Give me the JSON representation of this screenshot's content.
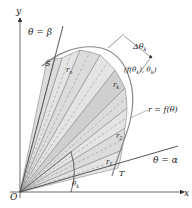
{
  "diagram": {
    "labels": {
      "y_axis": "y",
      "x_axis": "x",
      "origin": "O",
      "theta_beta": "θ = β",
      "theta_alpha": "θ = α",
      "point_S": "S",
      "point_T": "T",
      "r_n": "r",
      "r_n_sub": "n",
      "r_k": "r",
      "r_k_sub": "k",
      "r_2": "r",
      "r_2_sub": "2",
      "r_1": "r",
      "r_1_sub": "1",
      "delta_theta": "Δθ",
      "delta_theta_sub": "k",
      "point_label": "(f(θ",
      "point_label_sub": "k",
      "point_label_mid": "), θ",
      "point_label_sub2": "k",
      "point_label_end": ")",
      "curve_label": "r = f(θ)",
      "theta_k": "θ",
      "theta_k_sub": "k"
    },
    "colors": {
      "line": "#555555",
      "sector_fill": "#e6e6e6",
      "sector_fill_alt": "#d8d8d8",
      "highlight_sector": "#cfcfcf",
      "curve": "#888888"
    }
  }
}
